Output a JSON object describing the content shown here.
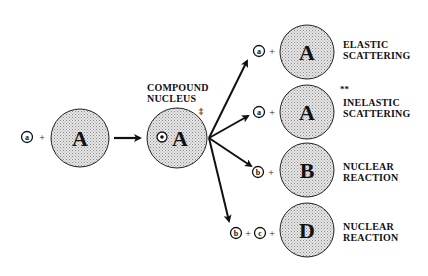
{
  "diagram": {
    "colors": {
      "nucleus_fill": "#d9d9d9",
      "stroke": "#111111",
      "background": "#ffffff"
    },
    "initial": {
      "projectile": "a",
      "plus": "+",
      "target": "A"
    },
    "compound": {
      "label_line1": "COMPOUND",
      "label_line2": "NUCLEUS",
      "projectile": "a",
      "target": "A",
      "excited_mark": "‡"
    },
    "outcomes": [
      {
        "particles": [
          "a"
        ],
        "plus": "+",
        "nucleus": "A",
        "mark": "",
        "label_line1": "ELASTIC",
        "label_line2": "SCATTERING"
      },
      {
        "particles": [
          "a"
        ],
        "plus": "+",
        "nucleus": "A",
        "mark": "**",
        "label_line1": "INELASTIC",
        "label_line2": "SCATTERING"
      },
      {
        "particles": [
          "b"
        ],
        "plus": "+",
        "nucleus": "B",
        "mark": "",
        "label_line1": "NUCLEAR",
        "label_line2": "REACTION"
      },
      {
        "particles": [
          "b",
          "c"
        ],
        "plus": "+",
        "nucleus": "D",
        "mark": "",
        "label_line1": "NUCLEAR",
        "label_line2": "REACTION"
      }
    ]
  }
}
